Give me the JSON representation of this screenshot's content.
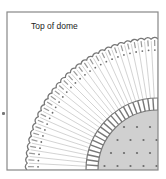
{
  "diagram": {
    "title_label": "Top of dome",
    "frame": {
      "x": 7,
      "y": 12,
      "width": 151,
      "height": 158
    },
    "center": {
      "x": 158,
      "y": 170
    },
    "outer_ring": {
      "radius": 131,
      "scallop_count": 30,
      "inner_dot_radius": 120
    },
    "spokes": {
      "count": 30
    },
    "inner_ring": {
      "outer_radius": 72,
      "inner_radius": 60,
      "segment_count": 22
    },
    "core": {
      "radius": 60,
      "dot_spacing": 13
    },
    "colors": {
      "frame": "#888888",
      "outline": "#777777",
      "spoke": "#c8c8c8",
      "core_fill": "#d0d0d0",
      "dot": "#6a6a6a",
      "ring_fill": "#ffffff"
    }
  }
}
